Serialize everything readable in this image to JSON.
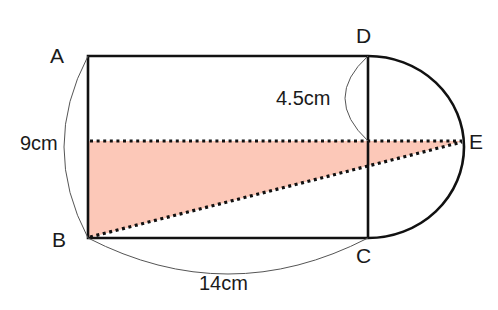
{
  "diagram": {
    "points": {
      "A": "A",
      "B": "B",
      "C": "C",
      "D": "D",
      "E": "E"
    },
    "dimensions": {
      "AB": "9cm",
      "BC": "14cm",
      "D_to_mid": "4.5cm"
    },
    "colors": {
      "shaded": "#fcc8b8",
      "stroke": "#111111",
      "thin": "#555555"
    }
  }
}
